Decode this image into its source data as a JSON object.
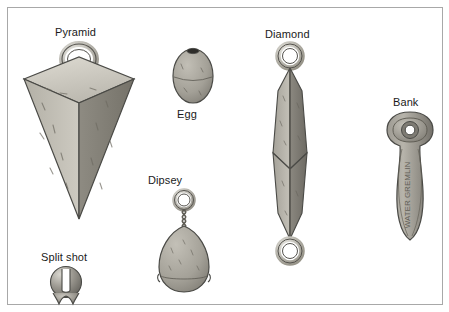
{
  "figure": {
    "title_present": false,
    "background_color": "#ffffff",
    "border_color": "#a8a8a8"
  },
  "palette": {
    "lead_light": "#c9c6bd",
    "lead_mid": "#a9a69c",
    "lead_dark": "#8d8a81",
    "lead_darker": "#6f6d66",
    "outline": "#4a4a46",
    "metal_light": "#e3e1db",
    "metal_shadow": "#9a978f",
    "label_color": "#1a1a1a"
  },
  "items": [
    {
      "id": "pyramid",
      "label": "Pyramid",
      "label_x": 47,
      "label_y": 18,
      "engraved_text": ""
    },
    {
      "id": "egg",
      "label": "Egg",
      "label_x": 169,
      "label_y": 100,
      "engraved_text": ""
    },
    {
      "id": "diamond",
      "label": "Diamond",
      "label_x": 257,
      "label_y": 20,
      "engraved_text": ""
    },
    {
      "id": "bank",
      "label": "Bank",
      "label_x": 385,
      "label_y": 88,
      "engraved_text": "WATER GREMLIN"
    },
    {
      "id": "dipsey",
      "label": "Dipsey",
      "label_x": 140,
      "label_y": 166,
      "engraved_text": ""
    },
    {
      "id": "split-shot",
      "label": "Split shot",
      "label_x": 33,
      "label_y": 243,
      "engraved_text": ""
    }
  ]
}
